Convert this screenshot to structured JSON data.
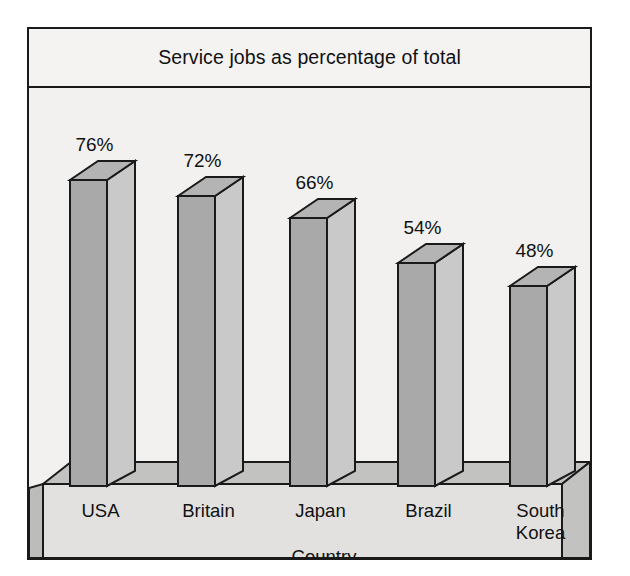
{
  "chart_data": {
    "type": "bar",
    "title": "Service jobs as percentage of total",
    "xlabel": "Country",
    "ylabel": "",
    "categories": [
      "USA",
      "Britain",
      "Japan",
      "Brazil",
      "South Korea"
    ],
    "values": [
      76,
      72,
      66,
      54,
      48
    ],
    "value_labels": [
      "76%",
      "72%",
      "66%",
      "54%",
      "48%"
    ],
    "unit": "%",
    "ylim": [
      0,
      100
    ],
    "grid": false,
    "legend": null,
    "style": "3d-bars",
    "colors": {
      "background": "#f2f1ef",
      "bar_front": "#a9a9a9",
      "bar_side": "#c9c9c9",
      "bar_top": "#b4b4b4",
      "base_front": "#e2e1df",
      "base_top": "#c2c2c0",
      "base_side": "#bcbcba",
      "outline": "#1a1a1a",
      "text": "#111111"
    }
  },
  "labels": {
    "category_lines": [
      [
        "USA"
      ],
      [
        "Britain"
      ],
      [
        "Japan"
      ],
      [
        "Brazil"
      ],
      [
        "South",
        "Korea"
      ]
    ]
  }
}
